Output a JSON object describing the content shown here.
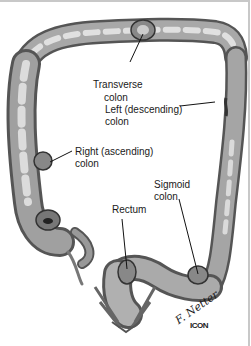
{
  "figure": {
    "labels": {
      "transverse_line1": "Transverse",
      "transverse_line2": "colon",
      "left_line1": "Left (descending)",
      "left_line2": "colon",
      "right_line1": "Right (ascending)",
      "right_line2": "colon",
      "sigmoid_line1": "Sigmoid",
      "sigmoid_line2": "colon",
      "rectum": "Rectum"
    },
    "signature": "F. Netter",
    "publisher_logo": "ICON"
  }
}
